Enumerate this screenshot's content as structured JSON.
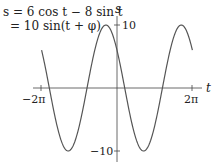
{
  "chart_data": {
    "type": "line",
    "title": "",
    "annotation": [
      "s = 6 cos t − 8 sin t",
      "= 10 sin(t + φ)"
    ],
    "xlabel": "t",
    "ylabel": "s",
    "x_ticks": [
      "−2π",
      "2π"
    ],
    "y_ticks": [
      "10",
      "−10"
    ],
    "xlim": [
      -6.283,
      6.283
    ],
    "ylim": [
      -10,
      10
    ],
    "grid": false,
    "series": [
      {
        "name": "s = 6cos t − 8sin t",
        "function": "6*cos(t) - 8*sin(t)",
        "t_range": [
          -6.283,
          6.283
        ],
        "amplitude": 10,
        "phase": 2.498
      }
    ]
  },
  "labels": {
    "eq1": "s = 6 cos t − 8 sin t",
    "eq2": "= 10 sin(t + φ)",
    "s_axis": "s",
    "t_axis": "t",
    "tick_pos_y": "10",
    "tick_neg_y": "−10",
    "tick_neg_x": "−2π",
    "tick_pos_x": "2π"
  }
}
